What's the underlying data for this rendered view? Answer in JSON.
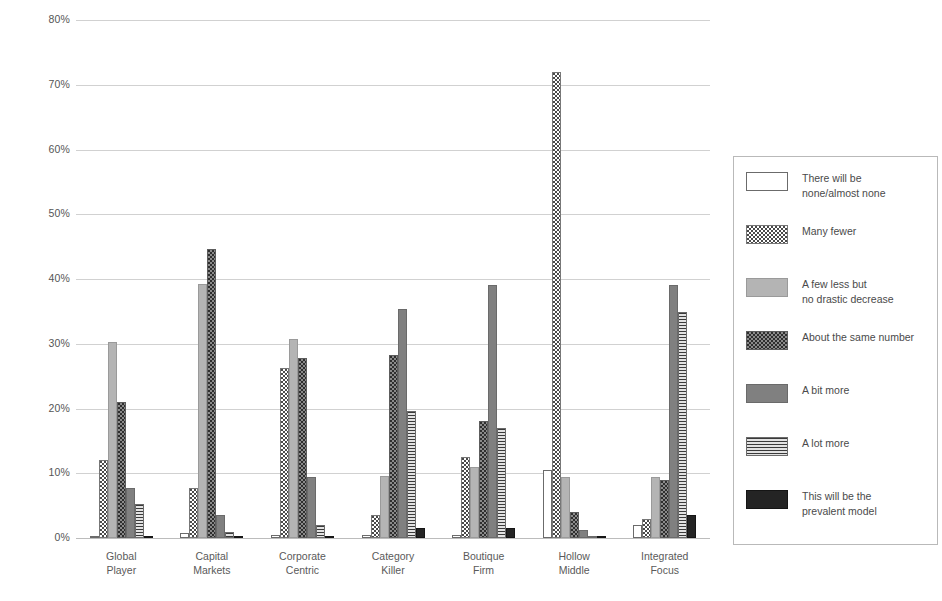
{
  "chart_data": {
    "type": "bar",
    "title": "",
    "xlabel": "",
    "ylabel": "",
    "ylim": [
      0,
      80
    ],
    "ytick_labels": [
      "80%",
      "70%",
      "60%",
      "50%",
      "40%",
      "30%",
      "20%",
      "10%",
      "0%"
    ],
    "ytick_values": [
      80,
      70,
      60,
      50,
      40,
      30,
      20,
      10,
      0
    ],
    "grid": true,
    "legend_position": "right",
    "categories": [
      "Global Player",
      "Capital Markets",
      "Corporate Centric",
      "Category Killer",
      "Boutique Firm",
      "Hollow Middle",
      "Integrated Focus"
    ],
    "category_lines": [
      [
        "Global",
        "Player"
      ],
      [
        "Capital",
        "Markets"
      ],
      [
        "Corporate",
        "Centric"
      ],
      [
        "Category",
        "Killer"
      ],
      [
        "Boutique",
        "Firm"
      ],
      [
        "Hollow",
        "Middle"
      ],
      [
        "Integrated",
        "Focus"
      ]
    ],
    "series": [
      {
        "name": "There will be none/almost none",
        "name_lines": [
          "There will be",
          "none/almost none"
        ],
        "pattern": "white-outline",
        "values": [
          0.3,
          0.8,
          0.4,
          0.4,
          0.4,
          10.5,
          2.0
        ]
      },
      {
        "name": "Many fewer",
        "name_lines": [
          "Many fewer"
        ],
        "pattern": "checkerboard-light",
        "values": [
          12.0,
          7.8,
          26.3,
          3.5,
          12.5,
          72.0,
          3.0
        ]
      },
      {
        "name": "A few less but no drastic decrease",
        "name_lines": [
          "A few less but",
          "no drastic decrease"
        ],
        "pattern": "solid-light-gray",
        "values": [
          30.3,
          39.2,
          30.8,
          9.6,
          11.0,
          9.5,
          9.5
        ]
      },
      {
        "name": "About the same number",
        "name_lines": [
          "About the same number"
        ],
        "pattern": "checkerboard-dark",
        "values": [
          21.0,
          44.6,
          27.8,
          28.2,
          18.0,
          4.0,
          9.0
        ]
      },
      {
        "name": "A bit more",
        "name_lines": [
          "A bit more"
        ],
        "pattern": "solid-mid-gray",
        "values": [
          7.8,
          3.6,
          9.4,
          35.4,
          39.0,
          1.2,
          39.0
        ]
      },
      {
        "name": "A lot more",
        "name_lines": [
          "A lot more"
        ],
        "pattern": "horizontal-stripes",
        "values": [
          5.2,
          1.0,
          2.0,
          19.6,
          17.0,
          0.3,
          34.9
        ]
      },
      {
        "name": "This will be the prevalent model",
        "name_lines": [
          "This will be the",
          "prevalent model"
        ],
        "pattern": "solid-black",
        "values": [
          0.3,
          0.3,
          0.3,
          1.5,
          1.5,
          0.2,
          3.6
        ]
      }
    ]
  }
}
